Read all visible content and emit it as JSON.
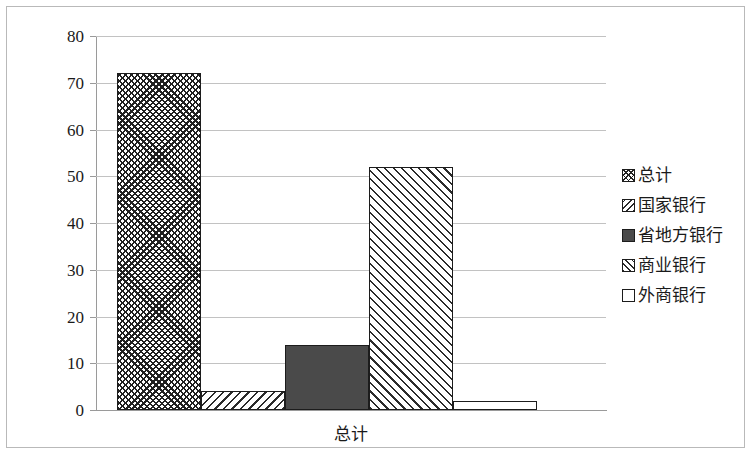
{
  "chart_data": {
    "type": "bar",
    "title": "",
    "subtitle": "",
    "xlabel": "总计",
    "ylabel": "",
    "categories": [
      "总计"
    ],
    "grid": true,
    "legend_position": "right",
    "ylim": [
      0,
      80
    ],
    "yticks": [
      0,
      10,
      20,
      30,
      40,
      50,
      60,
      70,
      80
    ],
    "ytick_labels": [
      "0",
      "10",
      "20",
      "30",
      "40",
      "50",
      "60",
      "70",
      "80"
    ],
    "series": [
      {
        "name": "总计",
        "values": [
          72
        ],
        "pattern": "crosshatch",
        "swatch_class": "sw-crosshatch",
        "bar_class": "bar-pattern-crosshatch"
      },
      {
        "name": "国家银行",
        "values": [
          4
        ],
        "pattern": "backdiagonal",
        "swatch_class": "sw-backdiagonal",
        "bar_class": "bar-pattern-backdiagonal"
      },
      {
        "name": "省地方银行",
        "values": [
          14
        ],
        "pattern": "solid",
        "swatch_class": "sw-solid",
        "bar_class": "bar-pattern-solid"
      },
      {
        "name": "商业银行",
        "values": [
          52
        ],
        "pattern": "diagonal",
        "swatch_class": "sw-diagonal",
        "bar_class": "bar-pattern-diagonal"
      },
      {
        "name": "外商银行",
        "values": [
          2
        ],
        "pattern": "empty",
        "swatch_class": "sw-empty",
        "bar_class": "bar-pattern-empty"
      }
    ],
    "colors": {
      "bar_outline": "#1c1c1c",
      "bar_solid_fill": "#4a4a4a",
      "gridline": "#c2c2c2",
      "axis": "#9a9a9a",
      "text": "#1a1a1a",
      "background": "#ffffff",
      "frame_border": "#b9b9b9"
    }
  }
}
